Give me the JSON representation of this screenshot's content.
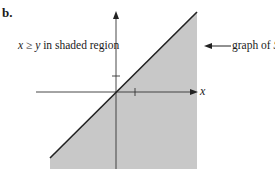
{
  "figure": {
    "part_label": "b.",
    "region_label": {
      "prefix_var": "x",
      "relation": " ≥ ",
      "suffix_var": "y",
      "rest": " in shaded region"
    },
    "graph_label": {
      "text": "graph of ",
      "var": "S"
    },
    "x_axis_label": "x",
    "x_tick_label": "1",
    "colors": {
      "shade": "#c8c8c8",
      "line": "#222222",
      "axis": "#333333"
    }
  },
  "diagram": {
    "type": "inequality-region",
    "inequality": "x >= y",
    "boundary_line": "y = x",
    "shaded_side": "below/right of y = x",
    "ticks": {
      "x": [
        1
      ],
      "y": [
        1
      ]
    }
  }
}
